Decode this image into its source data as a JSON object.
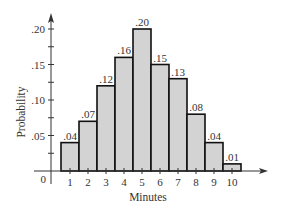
{
  "chart_data": {
    "type": "bar",
    "title": "",
    "xlabel": "Minutes",
    "ylabel": "Probability",
    "categories": [
      "1",
      "2",
      "3",
      "4",
      "5",
      "6",
      "7",
      "8",
      "9",
      "10"
    ],
    "values": [
      0.04,
      0.07,
      0.12,
      0.16,
      0.2,
      0.15,
      0.13,
      0.08,
      0.04,
      0.01
    ],
    "data_labels": [
      ".04",
      ".07",
      ".12",
      ".16",
      ".20",
      ".15",
      ".13",
      ".08",
      ".04",
      ".01"
    ],
    "y_ticks": [
      0.05,
      0.1,
      0.15,
      0.2
    ],
    "y_tick_labels": [
      ".05",
      ".10",
      ".15",
      ".20"
    ],
    "x_ticks": [
      1,
      2,
      3,
      4,
      5,
      6,
      7,
      8,
      9,
      10
    ],
    "origin_label": "0",
    "ylim": [
      0,
      0.22
    ],
    "grid": false,
    "legend": null,
    "bar_fill": "#d3d3d3",
    "bar_stroke": "#111111"
  }
}
